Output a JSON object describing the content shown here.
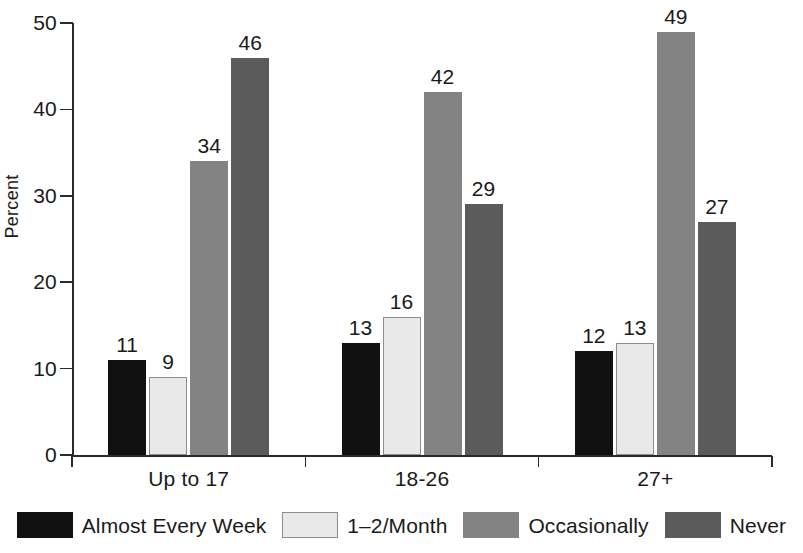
{
  "chart_data": {
    "type": "bar",
    "title": "",
    "subtitle": "",
    "xlabel": "",
    "ylabel": "Percent",
    "ylim": [
      0,
      50
    ],
    "yticks": [
      0,
      10,
      20,
      30,
      40,
      50
    ],
    "ytick_labels": [
      "0",
      "10",
      "20",
      "30",
      "40",
      "50"
    ],
    "grid": false,
    "legend_position": "bottom",
    "categories": [
      "Up to 17",
      "18-26",
      "27+"
    ],
    "series": [
      {
        "name": "Almost Every Week",
        "color": "#111111",
        "values": [
          11,
          13,
          12
        ]
      },
      {
        "name": "1–2/Month",
        "color": "#e9e9e9",
        "values": [
          9,
          16,
          13
        ]
      },
      {
        "name": "Occasionally",
        "color": "#838383",
        "values": [
          34,
          42,
          49
        ]
      },
      {
        "name": "Never",
        "color": "#5b5b5b",
        "values": [
          46,
          29,
          27
        ]
      }
    ],
    "value_labels": [
      [
        "11",
        "9",
        "34",
        "46"
      ],
      [
        "13",
        "16",
        "42",
        "29"
      ],
      [
        "12",
        "13",
        "49",
        "27"
      ]
    ],
    "annotations": []
  },
  "axis": {
    "y_label": "Percent"
  },
  "legend": {
    "items": [
      {
        "label": "Almost Every Week",
        "swatch": "s0"
      },
      {
        "label": "1–2/Month",
        "swatch": "s1"
      },
      {
        "label": "Occasionally",
        "swatch": "s2"
      },
      {
        "label": "Never",
        "swatch": "s3"
      }
    ]
  }
}
